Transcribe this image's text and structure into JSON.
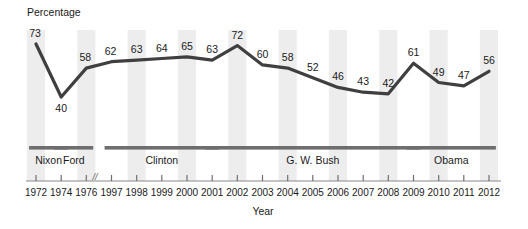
{
  "chart_data": {
    "type": "line",
    "title": "",
    "xlabel": "Year",
    "ylabel": "Percentage",
    "grid": false,
    "legend": false,
    "axis_break": {
      "present": true,
      "between": [
        "1976",
        "1997"
      ],
      "symbol": "//"
    },
    "categories": [
      "1972",
      "1974",
      "1976",
      "1997",
      "1998",
      "1999",
      "2000",
      "2001",
      "2002",
      "2003",
      "2004",
      "2005",
      "2006",
      "2007",
      "2008",
      "2009",
      "2010",
      "2011",
      "2012"
    ],
    "values": [
      73,
      40,
      58,
      62,
      63,
      64,
      65,
      63,
      72,
      60,
      58,
      52,
      46,
      43,
      42,
      61,
      49,
      47,
      56
    ],
    "series": [
      {
        "name": "Percentage",
        "values": [
          73,
          40,
          58,
          62,
          63,
          64,
          65,
          63,
          72,
          60,
          58,
          52,
          46,
          43,
          42,
          61,
          49,
          47,
          56
        ]
      }
    ],
    "ylim": [
      28,
      80
    ],
    "annotations": [
      {
        "label": "Nixon",
        "start": "1972",
        "end": "1974"
      },
      {
        "label": "Ford",
        "start": "1974",
        "end": "1976"
      },
      {
        "label": "Clinton",
        "start": "1997",
        "end": "2001"
      },
      {
        "label": "G. W. Bush",
        "start": "2001",
        "end": "2009"
      },
      {
        "label": "Obama",
        "start": "2009",
        "end": "2012"
      }
    ]
  },
  "axes": {
    "y_title": "Percentage",
    "x_title": "Year"
  },
  "ticks": {
    "x": [
      "1972",
      "1974",
      "1976",
      "1997",
      "1998",
      "1999",
      "2000",
      "2001",
      "2002",
      "2003",
      "2004",
      "2005",
      "2006",
      "2007",
      "2008",
      "2009",
      "2010",
      "2011",
      "2012"
    ]
  },
  "data_labels": [
    "73",
    "40",
    "58",
    "62",
    "63",
    "64",
    "65",
    "63",
    "72",
    "60",
    "58",
    "52",
    "46",
    "43",
    "42",
    "61",
    "49",
    "47",
    "56"
  ],
  "presidents": [
    {
      "label": "Nixon"
    },
    {
      "label": "Ford"
    },
    {
      "label": "Clinton"
    },
    {
      "label": "G. W. Bush"
    },
    {
      "label": "Obama"
    }
  ],
  "axis_break_symbol": "//",
  "colors": {
    "line": "#3f3f3f",
    "band": "#ededed",
    "president_bar": "#6e6e6e",
    "axis": "#6e6e6e",
    "text": "#1a1a1a",
    "background": "#ffffff"
  }
}
